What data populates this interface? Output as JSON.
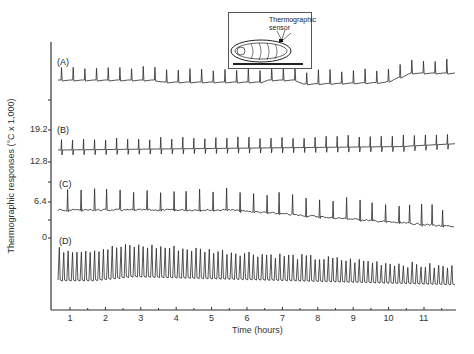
{
  "chart_data": {
    "type": "line",
    "title": "",
    "xlabel": "Time (hours)",
    "ylabel": "Thermographic responses (°C x 1,000)",
    "x_ticks": [
      1,
      2,
      3,
      4,
      5,
      6,
      7,
      8,
      9,
      10,
      11
    ],
    "x_range": [
      0.5,
      11.9
    ],
    "y_ticks": [
      "19.2",
      "12.8",
      "6.4",
      "0"
    ],
    "grid": false,
    "legend": null,
    "inset": {
      "label": "Thermographic sensor",
      "description": "Diagram of pupa lying on a surface with a thermographic sensor attached to its dorsal surface"
    },
    "series": [
      {
        "name": "(A)",
        "description": "Regular heartbeat-like spikes on a flat baseline; baseline rises around hour 10",
        "spike_count_approx": 34,
        "baseline_trend": "flat, slight dip ~8-9.5h, rise at ~10h then plateau"
      },
      {
        "name": "(B)",
        "description": "Biphasic spikes (up and down deflection) at regular intervals; slow upward drift after ~10.5h",
        "spike_count_approx": 36,
        "baseline_trend": "flat, slight rise after 10.5h"
      },
      {
        "name": "(C)",
        "description": "Upward spikes with noisy baseline; baseline drifts downward after ~8h, spikes cluster near end",
        "spike_count_approx": 30,
        "baseline_trend": "gradual decline from ~6h to 11.5h"
      },
      {
        "name": "(D)",
        "description": "Dense high-amplitude oscillations; amplitude largest at 1-2.5h and gradually decreases",
        "spike_count_approx": 90,
        "baseline_trend": "small bump at ~2h then slow decline"
      }
    ]
  },
  "axes": {
    "ylabel": "Thermographic responses (°C x 1,000)",
    "xlabel": "Time (hours)",
    "y_tick_labels": [
      "19.2",
      "12.8",
      "6.4",
      "0"
    ],
    "x_tick_labels": [
      "1",
      "2",
      "3",
      "4",
      "5",
      "6",
      "7",
      "8",
      "9",
      "10",
      "11"
    ]
  },
  "series_labels": [
    "(A)",
    "(B)",
    "(C)",
    "(D)"
  ],
  "inset": {
    "text_line1": "Thermographic",
    "text_line2": "sensor"
  },
  "colors": {
    "trace": "#2a2a2a",
    "axis": "#333333",
    "background": "#ffffff"
  }
}
